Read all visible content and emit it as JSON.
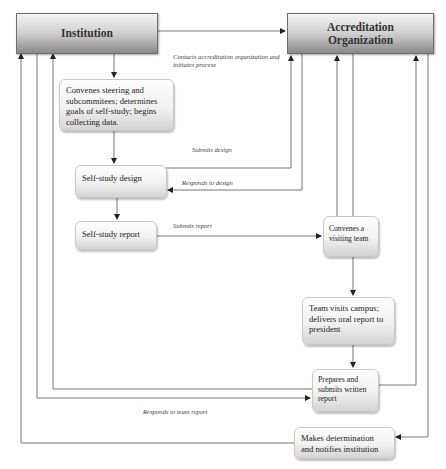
{
  "diagram": {
    "type": "flowchart",
    "entities": {
      "institution": "Institution",
      "accreditation": "Accreditation Organization"
    },
    "nodes": {
      "convenes_steering": "Convenes steering and subcommitees; determines goals of self-study; begins collecting data.",
      "self_study_design": "Self-study design",
      "self_study_report": "Self-study report",
      "convenes_team": "Convenes a visiting team",
      "team_visits": "Team visits campus; delivers oral report to president",
      "prepares_report": "Prepares and submits written report",
      "makes_determination": "Makes determination and notifies institution"
    },
    "edge_labels": {
      "contacts": "Contacts accreditation organization and initiates process",
      "submits_design": "Submits design",
      "responds_design": "Responds to design",
      "submits_report": "Submits report",
      "responds_team": "Responds to team report"
    },
    "edges": [
      {
        "from": "Institution",
        "to": "Accreditation Organization",
        "label": "Contacts accreditation organization and initiates process"
      },
      {
        "from": "Institution",
        "to": "Convenes steering and subcommitees"
      },
      {
        "from": "Convenes steering and subcommitees",
        "to": "Self-study design"
      },
      {
        "from": "Self-study design",
        "to": "Accreditation Organization",
        "label": "Submits design"
      },
      {
        "from": "Accreditation Organization",
        "to": "Self-study design",
        "label": "Responds to design"
      },
      {
        "from": "Self-study design",
        "to": "Self-study report"
      },
      {
        "from": "Self-study report",
        "to": "Convenes a visiting team",
        "label": "Submits report"
      },
      {
        "from": "Convenes a visiting team",
        "to": "Accreditation Organization"
      },
      {
        "from": "Convenes a visiting team",
        "to": "Team visits campus"
      },
      {
        "from": "Team visits campus",
        "to": "Prepares and submits written report"
      },
      {
        "from": "Prepares and submits written report",
        "to": "Institution"
      },
      {
        "from": "Institution",
        "to": "Prepares and submits written report",
        "label": "Responds to team report"
      },
      {
        "from": "Prepares and submits written report",
        "to": "Accreditation Organization"
      },
      {
        "from": "Accreditation Organization",
        "to": "Makes determination and notifies institution"
      },
      {
        "from": "Makes determination and notifies institution",
        "to": "Institution"
      }
    ]
  }
}
